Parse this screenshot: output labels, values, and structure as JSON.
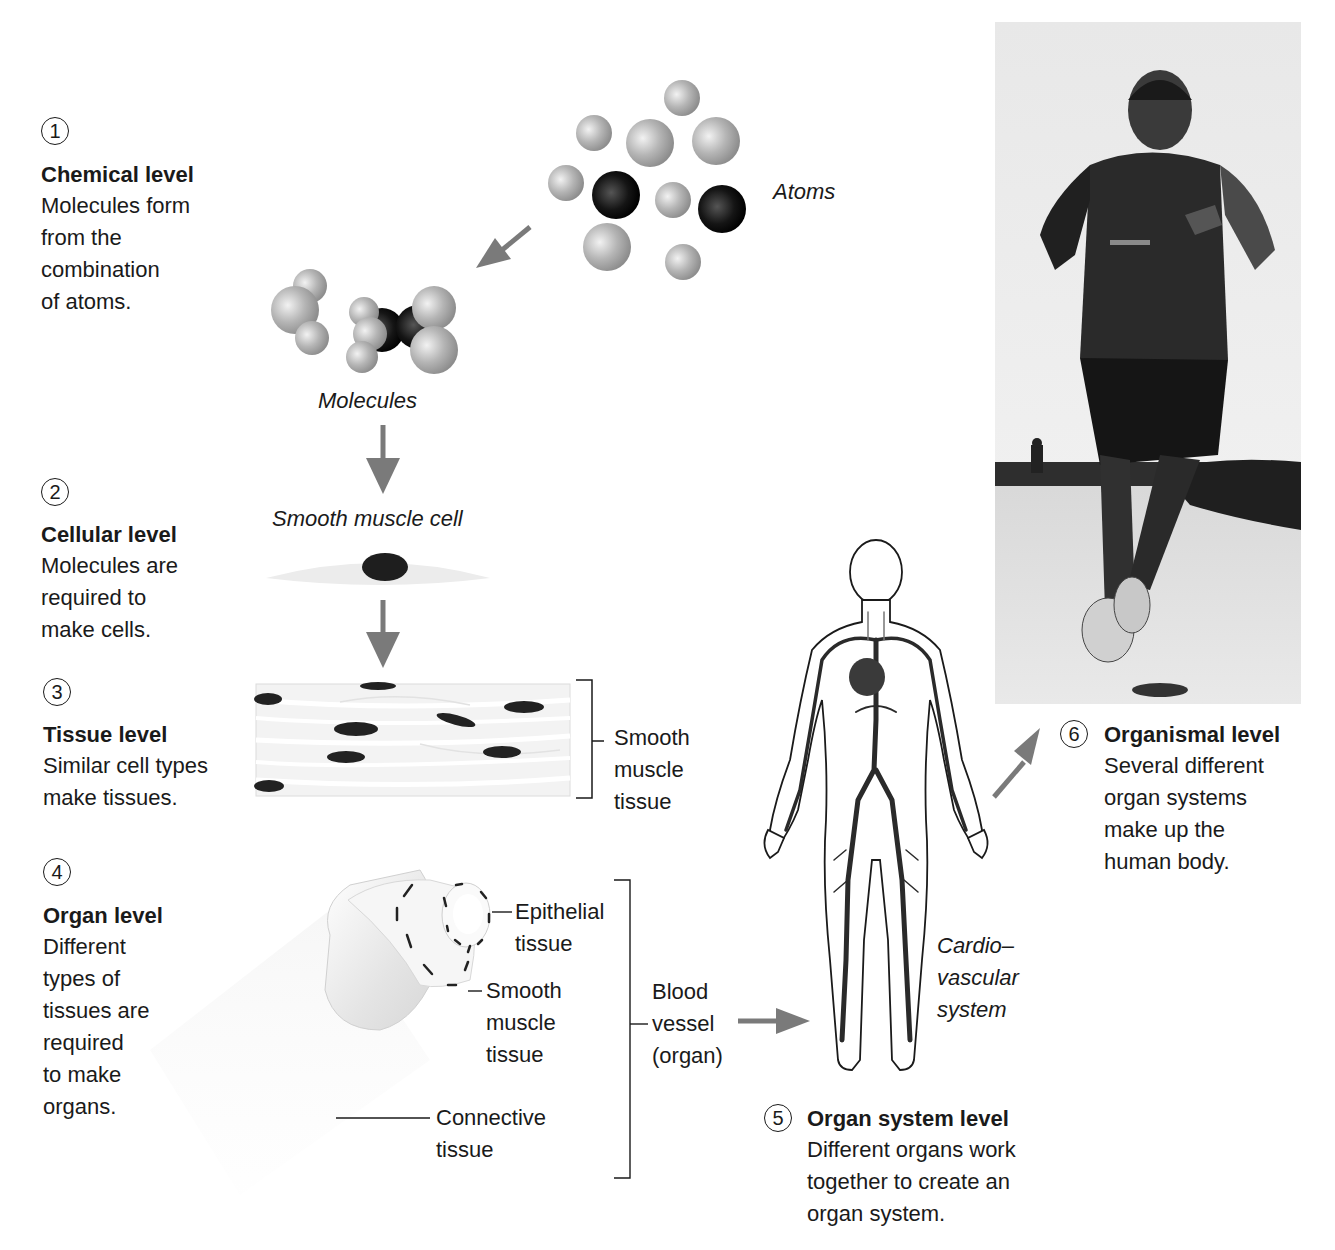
{
  "levels": [
    {
      "number": "1",
      "title": "Chemical level",
      "description": [
        "Molecules form",
        "from the",
        "combination",
        "of atoms."
      ]
    },
    {
      "number": "2",
      "title": "Cellular level",
      "description": [
        "Molecules are",
        "required to",
        "make cells."
      ]
    },
    {
      "number": "3",
      "title": "Tissue level",
      "description": [
        "Similar cell types",
        "make tissues."
      ]
    },
    {
      "number": "4",
      "title": "Organ level",
      "description": [
        "Different",
        "types of",
        "tissues are",
        "required",
        "to make",
        "organs."
      ]
    },
    {
      "number": "5",
      "title": "Organ system level",
      "description": [
        "Different organs work",
        "together to create an",
        "organ system."
      ]
    },
    {
      "number": "6",
      "title": "Organismal level",
      "description": [
        "Several different",
        "organ systems",
        "make up the",
        "human body."
      ]
    }
  ],
  "labels": {
    "atoms": "Atoms",
    "molecules": "Molecules",
    "smooth_muscle_cell": "Smooth muscle cell",
    "smooth_muscle_tissue": [
      "Smooth",
      "muscle",
      "tissue"
    ],
    "epithelial_tissue": [
      "Epithelial",
      "tissue"
    ],
    "organ_smooth_muscle": [
      "Smooth",
      "muscle",
      "tissue"
    ],
    "connective_tissue": [
      "Connective",
      "tissue"
    ],
    "blood_vessel": [
      "Blood",
      "vessel",
      "(organ)"
    ],
    "cardiovascular_system": [
      "Cardio–",
      "vascular",
      "system"
    ]
  },
  "colors": {
    "text": "#1a1a1a",
    "arrow": "#7a7a7a",
    "atom_light": "#b8b8b8",
    "atom_dark": "#111111",
    "nucleus": "#222222",
    "cell_body": "#eeeeee"
  }
}
